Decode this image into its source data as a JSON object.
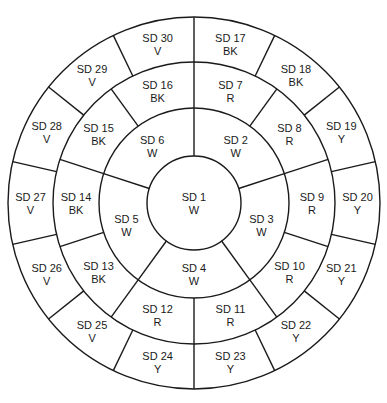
{
  "diagram": {
    "center": {
      "x": 194,
      "y": 203
    },
    "radii": [
      47,
      95,
      141,
      186
    ],
    "stroke_color": "#1a1a1a",
    "rings": [
      {
        "name": "center",
        "segments": [
          {
            "id": "SD 1",
            "code": "W"
          }
        ]
      },
      {
        "name": "inner-ring",
        "start_angle": 0,
        "segments": [
          {
            "id": "SD 2",
            "code": "W"
          },
          {
            "id": "SD 3",
            "code": "W"
          },
          {
            "id": "SD 4",
            "code": "W"
          },
          {
            "id": "SD 5",
            "code": "W"
          },
          {
            "id": "SD 6",
            "code": "W"
          }
        ]
      },
      {
        "name": "middle-ring",
        "start_angle": 0,
        "segments": [
          {
            "id": "SD 7",
            "code": "R"
          },
          {
            "id": "SD 8",
            "code": "R"
          },
          {
            "id": "SD 9",
            "code": "R"
          },
          {
            "id": "SD 10",
            "code": "R"
          },
          {
            "id": "SD 11",
            "code": "R"
          },
          {
            "id": "SD 12",
            "code": "R"
          },
          {
            "id": "SD 13",
            "code": "BK"
          },
          {
            "id": "SD 14",
            "code": "BK"
          },
          {
            "id": "SD 15",
            "code": "BK"
          },
          {
            "id": "SD 16",
            "code": "BK"
          }
        ]
      },
      {
        "name": "outer-ring",
        "start_angle": 0,
        "segments": [
          {
            "id": "SD 17",
            "code": "BK"
          },
          {
            "id": "SD 18",
            "code": "BK"
          },
          {
            "id": "SD 19",
            "code": "Y"
          },
          {
            "id": "SD 20",
            "code": "Y"
          },
          {
            "id": "SD 21",
            "code": "Y"
          },
          {
            "id": "SD 22",
            "code": "Y"
          },
          {
            "id": "SD 23",
            "code": "Y"
          },
          {
            "id": "SD 24",
            "code": "Y"
          },
          {
            "id": "SD 25",
            "code": "V"
          },
          {
            "id": "SD 26",
            "code": "V"
          },
          {
            "id": "SD 27",
            "code": "V"
          },
          {
            "id": "SD 28",
            "code": "V"
          },
          {
            "id": "SD 29",
            "code": "V"
          },
          {
            "id": "SD 30",
            "code": "V"
          }
        ]
      }
    ]
  }
}
